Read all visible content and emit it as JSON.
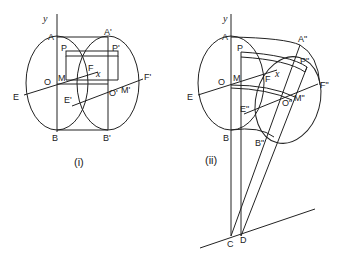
{
  "figure_i": {
    "caption": "(i)",
    "labels": {
      "y": "y",
      "A": "A",
      "A_prime": "A'",
      "P": "P",
      "P_prime": "P'",
      "O": "O",
      "M": "M",
      "F": "F",
      "x": "x",
      "F_prime": "F'",
      "E": "E",
      "E_prime": "E'",
      "O_prime": "O'",
      "M_prime": "M'",
      "B": "B",
      "B_prime": "B'"
    }
  },
  "figure_ii": {
    "caption": "(ii)",
    "labels": {
      "y": "y",
      "A": "A",
      "A_dprime": "A\"",
      "P": "P",
      "P_dprime": "P\"",
      "O": "O",
      "M": "M",
      "F": "F",
      "x": "x",
      "F_dprime": "F\"",
      "E": "E",
      "E_dprime": "E\"",
      "O_dprime": "O\"",
      "M_dprime": "M\"",
      "B": "B",
      "B_dprime": "B\"",
      "C": "C",
      "D": "D"
    }
  }
}
